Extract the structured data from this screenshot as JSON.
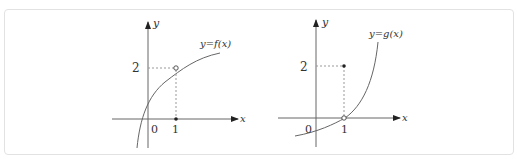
{
  "figures": [
    {
      "name": "graph-f",
      "curve_label": "y=f(x)",
      "y_axis_label": "y",
      "x_axis_label": "x",
      "origin_label": "0",
      "x_tick_label": "1",
      "y_tick_label": "2",
      "point_at_1_on_curve": "open circle at (1,2)",
      "point_on_axis": "filled dot at (1,0)"
    },
    {
      "name": "graph-g",
      "curve_label": "y=g(x)",
      "y_axis_label": "y",
      "x_axis_label": "x",
      "origin_label": "0",
      "x_tick_label": "1",
      "y_tick_label": "2",
      "point_at_1_on_curve": "open circle at (1,0)",
      "point_off_curve": "filled dot at (1,2)"
    }
  ],
  "colors": {
    "stroke": "#555555",
    "dashed": "#888888",
    "frame": "#e2e2e2"
  }
}
